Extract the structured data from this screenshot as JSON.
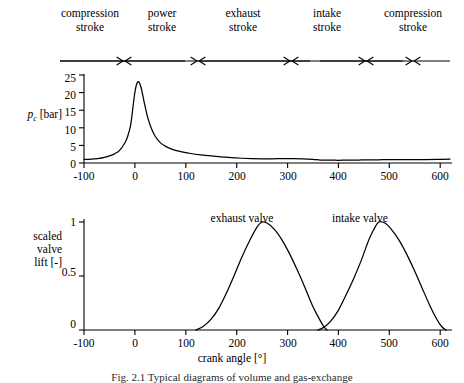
{
  "figure": {
    "caption": "Fig. 2.1  Typical diagrams of volume and gas-exchange",
    "xaxis_title": "crank angle [°]"
  },
  "strokes": {
    "items": [
      {
        "line1": "compression",
        "line2": "stroke",
        "start": -100,
        "end": 80
      },
      {
        "line1": "power",
        "line2": "stroke",
        "start": 80,
        "end": 260
      },
      {
        "line1": "exhaust",
        "line2": "stroke",
        "start": 260,
        "end": 440
      },
      {
        "line1": "intake",
        "line2": "stroke",
        "start": 440,
        "end": 620
      },
      {
        "line1": "compression",
        "line2": "stroke",
        "start": 620,
        "end": 720
      }
    ]
  },
  "chart_data": [
    {
      "type": "line",
      "id": "cylinder-pressure",
      "title": "",
      "xlabel": "crank angle [°]",
      "ylabel": "p_c [bar]",
      "ylabel_main": "p",
      "ylabel_sub": "c",
      "ylabel_unit": "[bar]",
      "xlim": [
        -100,
        620
      ],
      "ylim": [
        0,
        25
      ],
      "xticks": [
        -100,
        0,
        100,
        200,
        300,
        400,
        500,
        600
      ],
      "yticks": [
        0,
        5,
        10,
        15,
        20,
        25
      ],
      "grid": false,
      "legend": "none",
      "series": [
        {
          "name": "cylinder pressure",
          "x": [
            -100,
            -90,
            -80,
            -70,
            -60,
            -50,
            -40,
            -30,
            -20,
            -14,
            -8,
            -4,
            0,
            4,
            8,
            12,
            16,
            20,
            26,
            32,
            40,
            50,
            60,
            70,
            80,
            95,
            110,
            130,
            150,
            170,
            190,
            210,
            230,
            250,
            270,
            290,
            310,
            330,
            350,
            365,
            380,
            400,
            420,
            440,
            460,
            480,
            500,
            520,
            545,
            570,
            595,
            620
          ],
          "y": [
            1.0,
            1.05,
            1.15,
            1.3,
            1.6,
            2.0,
            2.6,
            3.6,
            5.6,
            7.6,
            11.0,
            15.5,
            20.0,
            22.6,
            23.0,
            21.6,
            19.0,
            16.2,
            12.6,
            10.0,
            7.6,
            5.8,
            4.8,
            4.1,
            3.6,
            3.1,
            2.7,
            2.3,
            2.0,
            1.75,
            1.5,
            1.35,
            1.25,
            1.2,
            1.2,
            1.25,
            1.25,
            1.2,
            1.05,
            0.85,
            0.8,
            0.78,
            0.8,
            0.85,
            0.9,
            0.92,
            0.95,
            0.95,
            0.95,
            0.95,
            1.0,
            1.1
          ]
        }
      ]
    },
    {
      "type": "line",
      "id": "scaled-valve-lift",
      "title": "",
      "xlabel": "crank angle [°]",
      "ylabel": "scaled valve lift [-]",
      "ylabel_lines": [
        "scaled",
        "valve",
        "lift [-]"
      ],
      "xlim": [
        -100,
        620
      ],
      "ylim": [
        0,
        1.08
      ],
      "xticks": [
        -100,
        0,
        100,
        200,
        300,
        400,
        500,
        600
      ],
      "yticks": [
        0,
        0.5,
        1
      ],
      "ytick_labels": [
        "0",
        "0.5",
        "1"
      ],
      "grid": false,
      "legend": "inline-annotations",
      "series": [
        {
          "name": "exhaust valve",
          "label_x": 250,
          "label_y": 1.14,
          "peak_x": 250,
          "peak_y": 1.0,
          "open_x": 120,
          "close_x": 378,
          "x": [
            120,
            135,
            150,
            165,
            180,
            195,
            210,
            225,
            240,
            250,
            260,
            275,
            290,
            305,
            320,
            335,
            350,
            362,
            372,
            378
          ],
          "y": [
            0.0,
            0.035,
            0.1,
            0.2,
            0.34,
            0.5,
            0.67,
            0.82,
            0.95,
            1.0,
            0.99,
            0.93,
            0.83,
            0.7,
            0.55,
            0.39,
            0.22,
            0.11,
            0.03,
            0.0
          ]
        },
        {
          "name": "intake valve",
          "label_x": 480,
          "label_y": 1.14,
          "peak_x": 480,
          "peak_y": 1.0,
          "open_x": 360,
          "close_x": 612,
          "x": [
            360,
            372,
            385,
            400,
            415,
            430,
            445,
            460,
            470,
            480,
            492,
            505,
            520,
            535,
            550,
            565,
            580,
            594,
            604,
            612
          ],
          "y": [
            0.0,
            0.025,
            0.08,
            0.18,
            0.32,
            0.47,
            0.64,
            0.83,
            0.93,
            1.0,
            0.99,
            0.93,
            0.83,
            0.7,
            0.55,
            0.39,
            0.23,
            0.1,
            0.03,
            0.0
          ]
        }
      ]
    }
  ]
}
